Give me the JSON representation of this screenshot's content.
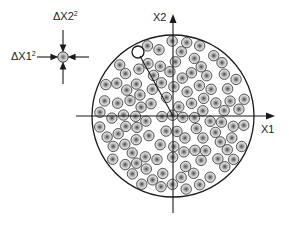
{
  "diagram": {
    "type": "sphere-packing illustration",
    "axes": {
      "x_label": "X1",
      "y_label": "X2"
    },
    "inset": {
      "label_x1": "ΔX1",
      "label_x1_exp": "2",
      "label_x2": "ΔX2",
      "label_x2_exp": "2",
      "description": "single noise sphere compressed by four arrows"
    },
    "large_circle": {
      "cx": 173,
      "cy": 116,
      "r": 81
    },
    "colors": {
      "line": "#1a1a1a",
      "sphere_outer": "#c8c8c8",
      "sphere_ring": "#555555",
      "sphere_inner": "#8a8a8a",
      "sphere_core": "#6e6e6e"
    }
  }
}
